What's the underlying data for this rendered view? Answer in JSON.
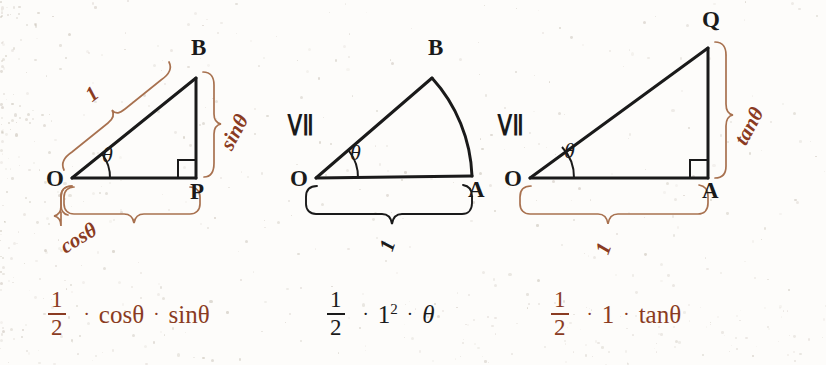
{
  "figure": {
    "colors": {
      "red_brown": "#8a3b22",
      "black": "#1a1a1a",
      "brace_red": "#a8714f",
      "background": "#fdfcfa"
    }
  },
  "panels": [
    {
      "id": "triangle-inner",
      "vertices": [
        {
          "name": "O",
          "label": "O"
        },
        {
          "name": "B",
          "label": "B"
        },
        {
          "name": "P",
          "label": "P"
        }
      ],
      "angle_label": "θ",
      "right_angle_at": "P",
      "measure_labels": [
        {
          "name": "hypotenuse-length",
          "label": "1",
          "color": "#8a3b22"
        },
        {
          "name": "opposite-side-length",
          "label": "sinθ",
          "color": "#8a3b22"
        },
        {
          "name": "adjacent-side-length",
          "label": "cosθ",
          "color": "#8a3b22"
        }
      ]
    },
    {
      "id": "circular-sector",
      "vertices": [
        {
          "name": "O",
          "label": "O"
        },
        {
          "name": "B",
          "label": "B"
        },
        {
          "name": "A",
          "label": "A"
        }
      ],
      "angle_label": "θ",
      "right_angle_at": null,
      "measure_labels": [
        {
          "name": "radius-length",
          "label": "1",
          "color": "#1a1a1a"
        }
      ]
    },
    {
      "id": "triangle-outer",
      "vertices": [
        {
          "name": "O",
          "label": "O"
        },
        {
          "name": "Q",
          "label": "Q"
        },
        {
          "name": "A",
          "label": "A"
        }
      ],
      "angle_label": "θ",
      "right_angle_at": "A",
      "measure_labels": [
        {
          "name": "tangent-side-length",
          "label": "tanθ",
          "color": "#8a3b22"
        },
        {
          "name": "base-length",
          "label": "1",
          "color": "#8a3b22"
        }
      ]
    }
  ],
  "relations": [
    {
      "name": "relation-1",
      "symbol": "≦"
    },
    {
      "name": "relation-2",
      "symbol": "≦"
    }
  ],
  "formulas": [
    {
      "id": "area-inner-triangle",
      "color": "#8a3b22",
      "numerator": "1",
      "denominator": "2",
      "dot": "·",
      "terms": [
        "cosθ",
        "sinθ"
      ]
    },
    {
      "id": "area-sector",
      "color": "#1a1a1a",
      "numerator": "1",
      "denominator": "2",
      "dot": "·",
      "base": "1",
      "exponent": "2",
      "theta": "θ"
    },
    {
      "id": "area-outer-triangle",
      "color": "#8a3b22",
      "numerator": "1",
      "denominator": "2",
      "dot": "·",
      "terms": [
        "1",
        "tanθ"
      ]
    }
  ]
}
